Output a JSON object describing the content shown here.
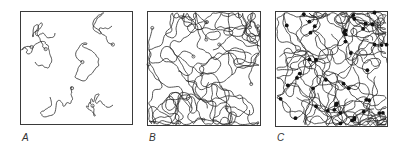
{
  "figure": {
    "panels": [
      {
        "id": "A",
        "label": "A",
        "description": "isolated coils (dilute)",
        "box": {
          "x": 20,
          "y": 11,
          "w": 113,
          "h": 114
        },
        "label_pos": {
          "x": 22,
          "y": 132
        },
        "coils": [
          {
            "cx": 55,
            "cy": 33,
            "r": 11,
            "steps": 46,
            "seed": 3
          },
          {
            "cx": 112,
            "cy": 26,
            "r": 10,
            "steps": 42,
            "seed": 7
          },
          {
            "cx": 35,
            "cy": 62,
            "r": 10,
            "steps": 42,
            "seed": 11
          },
          {
            "cx": 81,
            "cy": 64,
            "r": 10,
            "steps": 44,
            "seed": 17
          },
          {
            "cx": 50,
            "cy": 97,
            "r": 11,
            "steps": 44,
            "seed": 23
          },
          {
            "cx": 113,
            "cy": 105,
            "r": 11,
            "steps": 46,
            "seed": 29
          }
        ],
        "crosslinks": 0
      },
      {
        "id": "B",
        "label": "B",
        "description": "entangled chains (semi-dilute)",
        "box": {
          "x": 147,
          "y": 11,
          "w": 114,
          "h": 115
        },
        "label_pos": {
          "x": 149,
          "y": 132
        },
        "chains": 14,
        "steps": 70,
        "seed": 41,
        "crosslinks": 0
      },
      {
        "id": "C",
        "label": "C",
        "description": "cross-linked network",
        "box": {
          "x": 275,
          "y": 11,
          "w": 113,
          "h": 116
        },
        "label_pos": {
          "x": 277,
          "y": 132
        },
        "chains": 20,
        "steps": 70,
        "seed": 97,
        "crosslinks": 48
      }
    ],
    "colors": {
      "line": "#2b2b2b",
      "frame": "#3a3a3a",
      "dot": "#111111",
      "background": "#ffffff"
    }
  }
}
